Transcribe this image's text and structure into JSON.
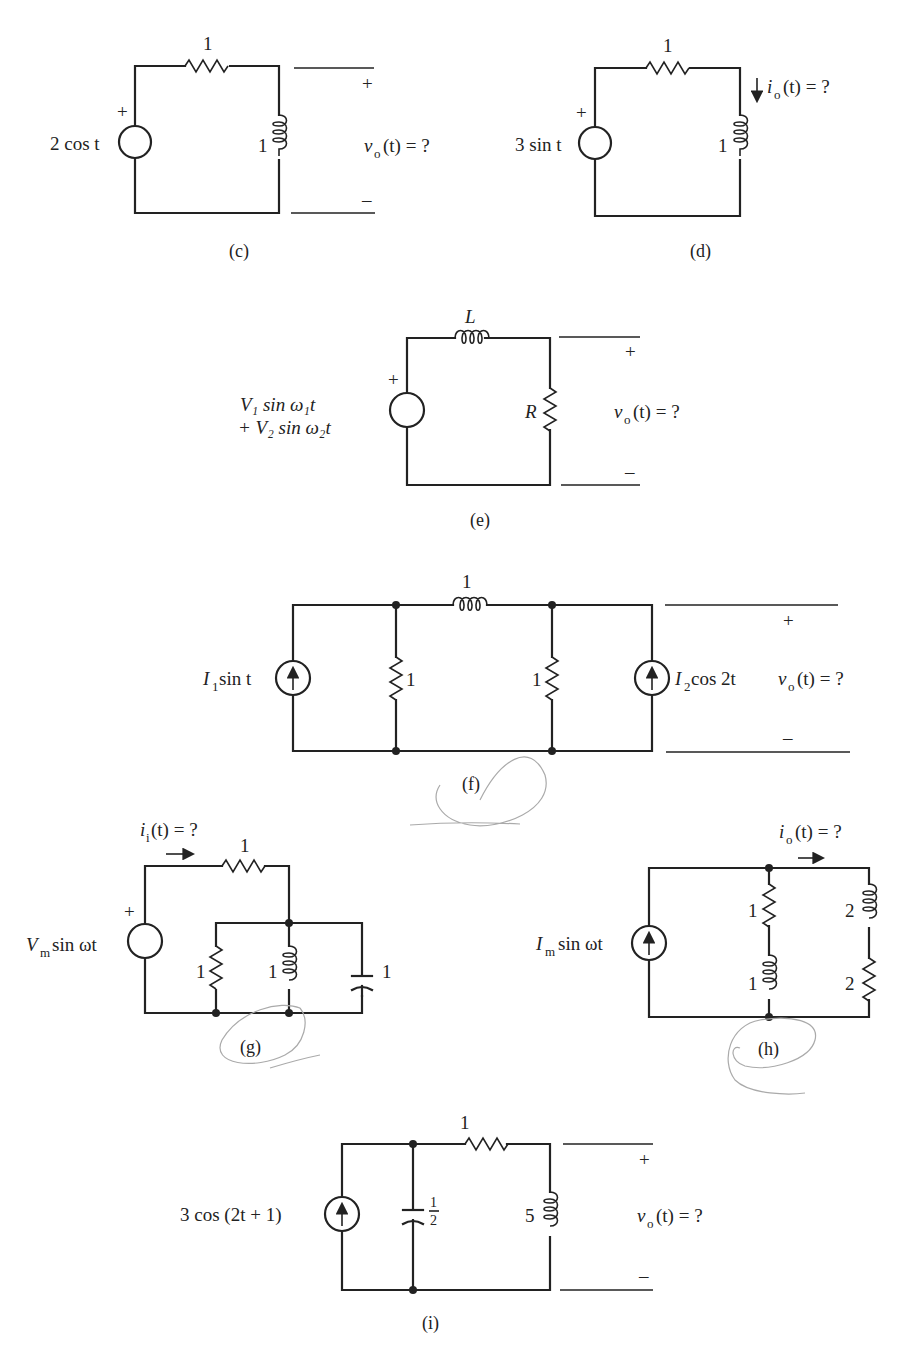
{
  "figure": {
    "circuits": [
      {
        "id": "c",
        "caption": "(c)",
        "source": {
          "type": "voltage",
          "label": "2 cos t",
          "polarity": "+"
        },
        "components": [
          {
            "type": "resistor",
            "value": "1",
            "position": "series-top"
          },
          {
            "type": "inductor",
            "value": "1",
            "position": "shunt-right"
          }
        ],
        "output": {
          "label": "v_o(t) = ?",
          "var": "v",
          "sub": "o",
          "rest": "(t)  =  ?",
          "plus": "+",
          "minus": "–"
        }
      },
      {
        "id": "d",
        "caption": "(d)",
        "source": {
          "type": "voltage",
          "label": "3 sin t",
          "polarity": "+"
        },
        "components": [
          {
            "type": "resistor",
            "value": "1",
            "position": "series-top"
          },
          {
            "type": "inductor",
            "value": "1",
            "position": "shunt-right"
          }
        ],
        "output": {
          "label": "i_o(t) = ?",
          "var": "i",
          "sub": "o",
          "rest": "(t)  =  ?",
          "arrow": "down"
        }
      },
      {
        "id": "e",
        "caption": "(e)",
        "source": {
          "type": "voltage",
          "line1": "V₁  sin  ω₁t",
          "line2": "+ V₂  sin  ω₂t",
          "polarity": "+"
        },
        "components": [
          {
            "type": "inductor",
            "value": "L",
            "position": "series-top"
          },
          {
            "type": "resistor",
            "value": "R",
            "position": "shunt-right"
          }
        ],
        "output": {
          "label": "v_o(t) = ?",
          "var": "v",
          "sub": "o",
          "rest": "(t)  =  ?",
          "plus": "+",
          "minus": "–"
        }
      },
      {
        "id": "f",
        "caption": "(f)",
        "source_left": {
          "type": "current",
          "label_var": "I",
          "label_sub": "1",
          "label_rest": " sin t",
          "arrow": "up"
        },
        "source_right": {
          "type": "current",
          "label_var": "I",
          "label_sub": "2",
          "label_rest": " cos 2t",
          "arrow": "up"
        },
        "components": [
          {
            "type": "resistor",
            "value": "1",
            "position": "shunt-left"
          },
          {
            "type": "inductor",
            "value": "1",
            "position": "series-top"
          },
          {
            "type": "resistor",
            "value": "1",
            "position": "shunt-right"
          }
        ],
        "output": {
          "label": "v_o(t) = ?",
          "var": "v",
          "sub": "o",
          "rest": "(t)  =  ?",
          "plus": "+",
          "minus": "–"
        }
      },
      {
        "id": "g",
        "caption": "(g)",
        "source": {
          "type": "voltage",
          "label_var": "V",
          "label_sub": "m",
          "label_rest": "  sin ωt",
          "polarity": "+"
        },
        "components": [
          {
            "type": "resistor",
            "value": "1",
            "position": "series-top"
          },
          {
            "type": "resistor",
            "value": "1",
            "position": "shunt-1"
          },
          {
            "type": "inductor",
            "value": "1",
            "position": "shunt-2"
          },
          {
            "type": "capacitor",
            "value": "1",
            "position": "shunt-3"
          }
        ],
        "output": {
          "label": "i_i(t) = ?",
          "var": "i",
          "sub": "i",
          "rest": "(t)  =  ?",
          "arrow": "right"
        }
      },
      {
        "id": "h",
        "caption": "(h)",
        "source": {
          "type": "current",
          "label_var": "I",
          "label_sub": "m",
          "label_rest": "  sin ωt",
          "arrow": "up"
        },
        "components": [
          {
            "type": "resistor",
            "value": "1",
            "position": "branch1-top"
          },
          {
            "type": "inductor",
            "value": "1",
            "position": "branch1-bottom"
          },
          {
            "type": "inductor",
            "value": "2",
            "position": "branch2-top"
          },
          {
            "type": "resistor",
            "value": "2",
            "position": "branch2-bottom"
          }
        ],
        "output": {
          "label": "i_o(t) = ?",
          "var": "i",
          "sub": "o",
          "rest": "(t) = ?",
          "arrow": "right"
        }
      },
      {
        "id": "i",
        "caption": "(i)",
        "source": {
          "type": "current",
          "label": "3 cos (2t + 1)",
          "arrow": "up"
        },
        "components": [
          {
            "type": "capacitor",
            "value_num": "1",
            "value_den": "2",
            "position": "shunt"
          },
          {
            "type": "resistor",
            "value": "1",
            "position": "series-top"
          },
          {
            "type": "inductor",
            "value": "5",
            "position": "shunt-right"
          }
        ],
        "output": {
          "label": "v_o(t) = ?",
          "var": "v",
          "sub": "o",
          "rest": "(t) = ?",
          "plus": "+",
          "minus": "–"
        }
      }
    ]
  }
}
